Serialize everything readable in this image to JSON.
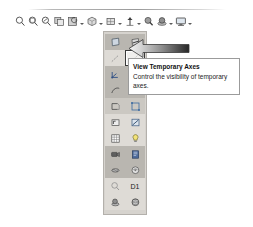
{
  "toolbar": {
    "name": "view-toolbar",
    "items": [
      {
        "icon": "zoom-to-fit-icon",
        "label": "Zoom to Fit",
        "caret": false
      },
      {
        "icon": "zoom-to-area-icon",
        "label": "Zoom to Area",
        "caret": false
      },
      {
        "icon": "zoom-in-out-icon",
        "label": "Zoom In/Out",
        "caret": false
      },
      {
        "icon": "zoom-to-selection-icon",
        "label": "Zoom to Selection",
        "caret": false
      },
      {
        "icon": "rotate-view-icon",
        "label": "Rotate View",
        "caret": true
      },
      {
        "icon": "view-orientation-icon",
        "label": "View Orientation",
        "caret": true
      },
      {
        "icon": "display-style-icon",
        "label": "Display Style",
        "caret": true
      },
      {
        "icon": "hide-show-items-icon",
        "label": "Hide/Show Items",
        "caret": true
      },
      {
        "icon": "edit-appearance-icon",
        "label": "Edit Appearance",
        "caret": true
      },
      {
        "icon": "apply-scene-icon",
        "label": "Apply Scene",
        "caret": true
      },
      {
        "icon": "view-settings-icon",
        "label": "View Settings",
        "caret": true
      }
    ]
  },
  "flyout": {
    "name": "hide-show-items-flyout",
    "buttons": [
      {
        "icon": "view-planes-icon",
        "label": "View Planes",
        "state": "normal",
        "text": ""
      },
      {
        "icon": "view-live-section-plane-icon",
        "label": "View Live Section Planes",
        "state": "normal",
        "text": ""
      },
      {
        "icon": "view-axes-icon",
        "label": "View Axes",
        "state": "normal",
        "text": ""
      },
      {
        "icon": "view-temporary-axes-icon",
        "label": "View Temporary Axes",
        "state": "selected",
        "text": ""
      },
      {
        "icon": "view-origins-icon",
        "label": "View Origins",
        "state": "normal",
        "text": ""
      },
      {
        "icon": "view-coordinate-systems-icon",
        "label": "View Coordinate Systems",
        "state": "normal",
        "text": ""
      },
      {
        "icon": "view-curves-icon",
        "label": "View Curves",
        "state": "normal",
        "text": ""
      },
      {
        "icon": "view-sketches-icon",
        "label": "View Sketches",
        "state": "normal",
        "text": ""
      },
      {
        "icon": "view-3d-sketches-icon",
        "label": "View 3D Sketches",
        "state": "normal",
        "text": ""
      },
      {
        "icon": "view-sketch-relations-icon",
        "label": "View Sketch Relations",
        "state": "normal",
        "text": ""
      },
      {
        "icon": "view-routing-points-icon",
        "label": "View Routing Points",
        "state": "normal",
        "text": ""
      },
      {
        "icon": "view-parting-lines-icon",
        "label": "View Parting Lines",
        "state": "normal",
        "text": ""
      },
      {
        "icon": "view-lights-icon",
        "label": "View Lights",
        "state": "normal",
        "text": ""
      },
      {
        "icon": "view-cameras-icon",
        "label": "View Cameras",
        "state": "normal",
        "text": ""
      },
      {
        "icon": "view-sketch-dimensions-icon",
        "label": "View Sketch Dimensions",
        "state": "normal",
        "text": ""
      },
      {
        "icon": "view-all-annotations-icon",
        "label": "View All Annotations",
        "state": "normal",
        "text": ""
      },
      {
        "icon": "view-weld-beads-icon",
        "label": "View Weld Beads",
        "state": "normal",
        "text": ""
      },
      {
        "icon": "view-decals-icon",
        "label": "View Decals",
        "state": "normal",
        "text": ""
      },
      {
        "icon": "view-grid-icon",
        "label": "View Grid",
        "state": "normal",
        "text": ""
      },
      {
        "icon": "view-dimension-names-icon",
        "label": "View Dimension Names",
        "state": "normal",
        "text": "D1"
      },
      {
        "icon": "view-hidden-edges-icon",
        "label": "View Hidden Edges",
        "state": "normal",
        "text": ""
      },
      {
        "icon": "view-appearances-icon",
        "label": "View Appearances",
        "state": "normal",
        "text": ""
      }
    ]
  },
  "callout": {
    "name": "pointer-arrow",
    "direction": "left",
    "gradient_from": "#f2f2f2",
    "gradient_to": "#2b2b2b"
  },
  "tooltip": {
    "title": "View Temporary Axes",
    "description": "Control the visibility of temporary axes.",
    "background": "#ffffff",
    "border": "#9b9b9b"
  },
  "colors": {
    "panel_bg": "#d6d3ce",
    "panel_border": "#b3b0ab",
    "cell_dark": "#b9b6b0",
    "cell_light": "#dedbd6",
    "selection_border": "#3a3a3a",
    "page_bg": "#ffffff"
  }
}
